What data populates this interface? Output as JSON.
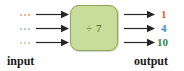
{
  "diagram": {
    "type": "function-machine",
    "machine": {
      "operation_label": "÷ 7",
      "box_fill_color": "#c9dd9a",
      "box_border_color": "#8aa85c"
    },
    "captions": {
      "input": "input",
      "output": "output"
    },
    "rows": [
      {
        "input_placeholder": "...",
        "input_dot_color": "#e8a36a",
        "output_value": "1",
        "output_color": "#e8612c"
      },
      {
        "input_placeholder": "...",
        "input_dot_color": "#8fc3de",
        "output_value": "4",
        "output_color": "#3b8fc4"
      },
      {
        "input_placeholder": "...",
        "input_dot_color": "#b9cf9a",
        "output_value": "10",
        "output_color": "#1f8a4c"
      }
    ],
    "arrow_color": "#262626"
  }
}
